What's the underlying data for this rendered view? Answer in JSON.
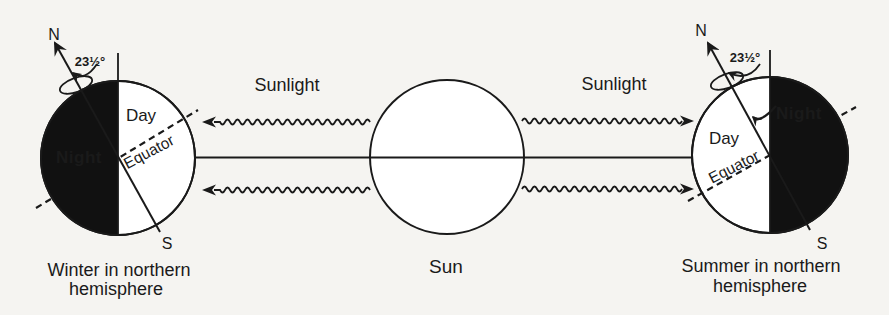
{
  "sun": {
    "label": "Sun"
  },
  "rays": {
    "left_label": "Sunlight",
    "right_label": "Sunlight"
  },
  "earth_left": {
    "north": "N",
    "south": "S",
    "tilt_angle": "23½°",
    "day": "Day",
    "night": "Night",
    "equator": "Equator",
    "caption_line1": "Winter in northern",
    "caption_line2": "hemisphere"
  },
  "earth_right": {
    "north": "N",
    "south": "S",
    "tilt_angle": "23½°",
    "day": "Day",
    "night": "Night",
    "equator": "Equator",
    "caption_line1": "Summer in northern",
    "caption_line2": "hemisphere"
  },
  "colors": {
    "ink": "#1a1a1a",
    "night_fill": "#111111",
    "night_text": "#ffffff",
    "paper": "#f5f4f1"
  }
}
